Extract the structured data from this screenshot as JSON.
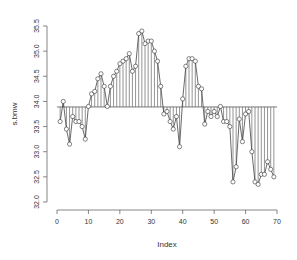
{
  "chart_data": {
    "type": "line",
    "subtype": "points-with-vertical-lines-to-mean",
    "title": "",
    "xlabel": "Index",
    "ylabel": "s.bmw",
    "xlim": [
      0,
      70
    ],
    "ylim": [
      32.0,
      35.5
    ],
    "x_ticks": [
      0,
      10,
      20,
      30,
      40,
      50,
      60,
      70
    ],
    "y_ticks": [
      32.0,
      32.5,
      33.0,
      33.5,
      34.0,
      34.5,
      35.0,
      35.5
    ],
    "y_tick_labels": [
      "32.0",
      "32.5",
      "33.0",
      "33.5",
      "34.0",
      "34.5",
      "35.0",
      "35.5"
    ],
    "reference_line": 33.89,
    "grid": false,
    "legend": null,
    "x": [
      1,
      2,
      3,
      4,
      5,
      6,
      7,
      8,
      9,
      10,
      11,
      12,
      13,
      14,
      15,
      16,
      17,
      18,
      19,
      20,
      21,
      22,
      23,
      24,
      25,
      26,
      27,
      28,
      29,
      30,
      31,
      32,
      33,
      34,
      35,
      36,
      37,
      38,
      39,
      40,
      41,
      42,
      43,
      44,
      45,
      46,
      47,
      48,
      49,
      50,
      51,
      52,
      53,
      54,
      55,
      56,
      57,
      58,
      59,
      60,
      61,
      62,
      63,
      64,
      65,
      66,
      67,
      68,
      69
    ],
    "values": [
      33.6,
      34.0,
      33.45,
      33.15,
      33.7,
      33.6,
      33.6,
      33.5,
      33.25,
      33.9,
      34.15,
      34.2,
      34.45,
      34.55,
      34.3,
      33.9,
      34.3,
      34.5,
      34.6,
      34.75,
      34.8,
      34.85,
      34.95,
      34.6,
      34.7,
      35.35,
      35.4,
      35.15,
      35.2,
      35.2,
      35.0,
      34.8,
      34.3,
      33.75,
      33.8,
      33.6,
      33.45,
      33.7,
      33.1,
      34.05,
      34.7,
      34.85,
      34.85,
      34.8,
      34.3,
      34.25,
      33.55,
      33.8,
      33.7,
      33.8,
      33.7,
      33.9,
      33.6,
      33.6,
      33.5,
      32.4,
      32.7,
      33.65,
      33.2,
      33.75,
      33.8,
      33.0,
      32.4,
      32.35,
      32.55,
      32.55,
      32.8,
      32.65,
      32.5
    ]
  }
}
